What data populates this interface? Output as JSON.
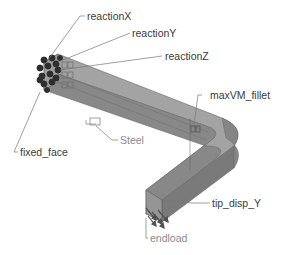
{
  "model": {
    "material": "Steel",
    "colors": {
      "body_top": "#9a9a9a",
      "body_side": "#7c7c7c",
      "body_front": "#8a8a8a",
      "outline": "#5a5a5a",
      "leader": "#6f6f6f",
      "constraint_glyph": "#2e2e2e",
      "load_arrow": "#555555"
    }
  },
  "labels": {
    "reactionX": "reactionX",
    "reactionY": "reactionY",
    "reactionZ": "reactionZ",
    "maxVM_fillet": "maxVM_fillet",
    "steel": "Steel",
    "fixed_face": "fixed_face",
    "tip_disp_Y": "tip_disp_Y",
    "endload": "endload"
  }
}
